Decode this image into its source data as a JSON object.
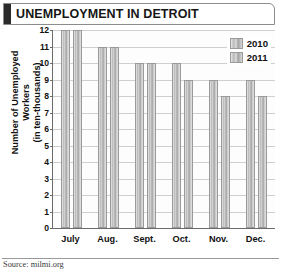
{
  "title": "UNEMPLOYMENT IN DETROIT",
  "source": "Source: milmi.org",
  "legend": {
    "items": [
      {
        "label": "2010",
        "swatch": "legend-swatch-2010"
      },
      {
        "label": "2011",
        "swatch": "legend-swatch-2011"
      }
    ]
  },
  "axes": {
    "ylabel_line1": "Number of Unemployed Workers",
    "ylabel_line2": "(in ten-thousands)",
    "yticks": [
      "12",
      "11",
      "10",
      "9",
      "8",
      "7",
      "6",
      "5",
      "4",
      "3",
      "2",
      "1",
      "0"
    ],
    "xlabels": [
      "July",
      "Aug.",
      "Sept.",
      "Oct.",
      "Nov.",
      "Dec."
    ]
  },
  "colors": {
    "title_accent": "#2b2b2b",
    "bar_fill": "#bdbdbd",
    "bar_border": "#9a9a9a",
    "grid": "#cfcfcf",
    "axis": "#6b6b6b"
  },
  "chart_data": {
    "type": "bar",
    "title": "UNEMPLOYMENT IN DETROIT",
    "xlabel": "",
    "ylabel": "Number of Unemployed Workers (in ten-thousands)",
    "ylim": [
      0,
      12
    ],
    "ytick_step": 1,
    "grid": true,
    "legend_position": "top-right",
    "categories": [
      "July",
      "Aug.",
      "Sept.",
      "Oct.",
      "Nov.",
      "Dec."
    ],
    "series": [
      {
        "name": "2010",
        "values": [
          12,
          11,
          10,
          10,
          9,
          9
        ]
      },
      {
        "name": "2011",
        "values": [
          12,
          11,
          10,
          9,
          8,
          8
        ]
      }
    ],
    "source": "Source: milmi.org"
  }
}
